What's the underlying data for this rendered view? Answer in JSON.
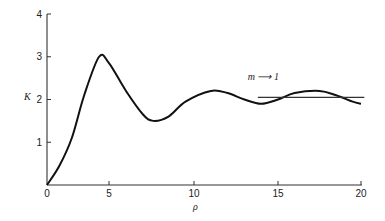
{
  "chart_data": {
    "type": "line",
    "title": "",
    "xlabel": "ρ",
    "ylabel": "K",
    "xlim": [
      0,
      20
    ],
    "ylim": [
      0,
      4
    ],
    "grid": false,
    "x_ticks": [
      "0",
      "5",
      "10",
      "15",
      "20"
    ],
    "y_ticks": [
      "1",
      "2",
      "3",
      "4"
    ],
    "series": [
      {
        "name": "K(ρ)",
        "x": [
          0,
          1,
          2,
          3,
          4.2,
          5,
          6,
          7,
          7.6,
          8.5,
          9.5,
          11,
          12,
          13,
          14,
          15,
          16,
          17.5,
          18.5,
          19.5,
          20
        ],
        "values": [
          0,
          0.45,
          1.1,
          2.1,
          3.0,
          2.85,
          2.2,
          1.65,
          1.5,
          1.6,
          1.95,
          2.2,
          2.15,
          2.0,
          1.9,
          2.0,
          2.15,
          2.2,
          2.1,
          1.95,
          1.9
        ]
      },
      {
        "name": "m → 1 asymptote",
        "x": [
          13.8,
          20.2
        ],
        "values": [
          2.05,
          2.05
        ]
      }
    ],
    "annotations": [
      {
        "text": "m ⟶ 1",
        "x": 13.2,
        "y": 2.45
      }
    ]
  },
  "labels": {
    "x_axis": "ρ",
    "y_axis": "K",
    "annotation": "m ⟶ 1",
    "origin": "0"
  }
}
